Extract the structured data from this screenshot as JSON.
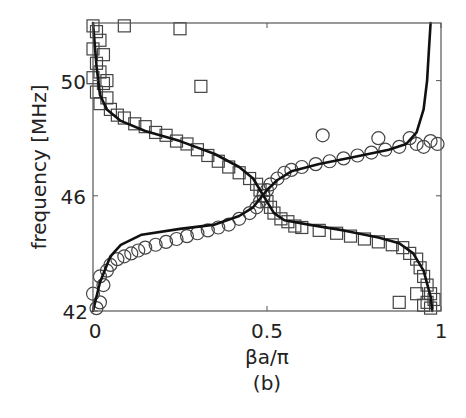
{
  "chart_data": {
    "type": "scatter",
    "title": "",
    "caption": "(b)",
    "xlabel": "βa/π",
    "ylabel": "frequency [MHz]",
    "xlim": [
      0,
      1
    ],
    "ylim": [
      42,
      52
    ],
    "xticks": [
      0,
      0.5,
      1
    ],
    "xtick_labels": [
      "0",
      "0.5",
      "1"
    ],
    "yticks": [
      42,
      46,
      50
    ],
    "ytick_labels": [
      "42",
      "46",
      "50"
    ],
    "grid": false,
    "legend": null,
    "series": [
      {
        "name": "measured-upper-branch-squares",
        "marker": "square",
        "points": [
          [
            0.0,
            51.9
          ],
          [
            0.01,
            51.7
          ],
          [
            0.02,
            51.4
          ],
          [
            0.0,
            51.1
          ],
          [
            0.03,
            50.9
          ],
          [
            0.01,
            50.6
          ],
          [
            0.02,
            50.3
          ],
          [
            0.0,
            50.1
          ],
          [
            0.03,
            49.9
          ],
          [
            0.01,
            49.6
          ],
          [
            0.04,
            49.4
          ],
          [
            0.02,
            49.2
          ],
          [
            0.05,
            49.0
          ],
          [
            0.07,
            48.8
          ],
          [
            0.09,
            48.7
          ],
          [
            0.12,
            48.5
          ],
          [
            0.15,
            48.4
          ],
          [
            0.18,
            48.2
          ],
          [
            0.21,
            48.1
          ],
          [
            0.24,
            47.9
          ],
          [
            0.27,
            47.8
          ],
          [
            0.3,
            47.6
          ],
          [
            0.33,
            47.4
          ],
          [
            0.36,
            47.2
          ],
          [
            0.39,
            47.0
          ],
          [
            0.42,
            46.8
          ],
          [
            0.45,
            46.6
          ],
          [
            0.47,
            46.4
          ],
          [
            0.48,
            46.2
          ],
          [
            0.49,
            46.0
          ],
          [
            0.5,
            45.8
          ],
          [
            0.51,
            45.6
          ],
          [
            0.52,
            45.4
          ],
          [
            0.54,
            45.2
          ],
          [
            0.56,
            45.1
          ],
          [
            0.58,
            44.95
          ],
          [
            0.6,
            44.9
          ],
          [
            0.65,
            44.8
          ],
          [
            0.7,
            44.7
          ],
          [
            0.74,
            44.6
          ],
          [
            0.78,
            44.5
          ],
          [
            0.82,
            44.4
          ],
          [
            0.86,
            44.3
          ],
          [
            0.89,
            44.2
          ],
          [
            0.91,
            44.0
          ],
          [
            0.93,
            43.8
          ],
          [
            0.94,
            43.5
          ],
          [
            0.95,
            43.2
          ],
          [
            0.96,
            42.9
          ],
          [
            0.97,
            42.6
          ],
          [
            0.96,
            42.3
          ],
          [
            0.97,
            42.1
          ],
          [
            0.98,
            42.4
          ],
          [
            0.95,
            42.2
          ]
        ],
        "outliers": [
          [
            0.09,
            51.9
          ],
          [
            0.25,
            51.8
          ],
          [
            0.31,
            49.8
          ],
          [
            0.88,
            42.3
          ],
          [
            0.93,
            42.6
          ],
          [
            0.04,
            50.0
          ]
        ]
      },
      {
        "name": "measured-lower-branch-circles",
        "marker": "circle",
        "points": [
          [
            0.01,
            42.1
          ],
          [
            0.02,
            42.3
          ],
          [
            0.0,
            42.6
          ],
          [
            0.03,
            42.9
          ],
          [
            0.02,
            43.2
          ],
          [
            0.04,
            43.4
          ],
          [
            0.05,
            43.6
          ],
          [
            0.07,
            43.8
          ],
          [
            0.09,
            43.9
          ],
          [
            0.11,
            44.0
          ],
          [
            0.13,
            44.1
          ],
          [
            0.15,
            44.2
          ],
          [
            0.18,
            44.3
          ],
          [
            0.21,
            44.4
          ],
          [
            0.24,
            44.5
          ],
          [
            0.27,
            44.6
          ],
          [
            0.3,
            44.7
          ],
          [
            0.33,
            44.8
          ],
          [
            0.36,
            44.9
          ],
          [
            0.39,
            45.0
          ],
          [
            0.42,
            45.2
          ],
          [
            0.45,
            45.4
          ],
          [
            0.47,
            45.6
          ],
          [
            0.48,
            45.8
          ],
          [
            0.49,
            46.0
          ],
          [
            0.5,
            46.2
          ],
          [
            0.51,
            46.4
          ],
          [
            0.53,
            46.6
          ],
          [
            0.55,
            46.8
          ],
          [
            0.57,
            46.9
          ],
          [
            0.6,
            47.0
          ],
          [
            0.64,
            47.1
          ],
          [
            0.68,
            47.2
          ],
          [
            0.72,
            47.3
          ],
          [
            0.76,
            47.4
          ],
          [
            0.8,
            47.5
          ],
          [
            0.84,
            47.6
          ],
          [
            0.88,
            47.7
          ],
          [
            0.93,
            47.8
          ],
          [
            0.97,
            47.9
          ],
          [
            0.99,
            47.8
          ],
          [
            0.95,
            47.7
          ]
        ],
        "outliers": [
          [
            0.66,
            48.1
          ],
          [
            0.82,
            48.0
          ],
          [
            0.91,
            48.0
          ]
        ]
      },
      {
        "name": "theory-curve-1",
        "style": "line",
        "points": [
          [
            0.0,
            52.0
          ],
          [
            0.01,
            50.5
          ],
          [
            0.02,
            49.5
          ],
          [
            0.04,
            49.0
          ],
          [
            0.08,
            48.6
          ],
          [
            0.15,
            48.25
          ],
          [
            0.25,
            47.9
          ],
          [
            0.35,
            47.45
          ],
          [
            0.42,
            47.0
          ],
          [
            0.46,
            46.6
          ],
          [
            0.48,
            46.2
          ],
          [
            0.5,
            45.8
          ],
          [
            0.52,
            45.4
          ],
          [
            0.55,
            45.15
          ],
          [
            0.62,
            45.0
          ],
          [
            0.72,
            44.8
          ],
          [
            0.82,
            44.55
          ],
          [
            0.88,
            44.35
          ],
          [
            0.92,
            44.0
          ],
          [
            0.95,
            43.4
          ],
          [
            0.97,
            42.5
          ],
          [
            0.975,
            42.0
          ]
        ]
      },
      {
        "name": "theory-curve-2",
        "style": "line",
        "points": [
          [
            0.0,
            42.0
          ],
          [
            0.02,
            43.0
          ],
          [
            0.05,
            43.9
          ],
          [
            0.08,
            44.3
          ],
          [
            0.14,
            44.65
          ],
          [
            0.25,
            44.85
          ],
          [
            0.35,
            45.0
          ],
          [
            0.42,
            45.3
          ],
          [
            0.46,
            45.6
          ],
          [
            0.48,
            45.9
          ],
          [
            0.5,
            46.2
          ],
          [
            0.53,
            46.55
          ],
          [
            0.57,
            46.85
          ],
          [
            0.65,
            47.1
          ],
          [
            0.75,
            47.35
          ],
          [
            0.85,
            47.6
          ],
          [
            0.9,
            47.8
          ],
          [
            0.93,
            48.2
          ],
          [
            0.95,
            49.0
          ],
          [
            0.96,
            50.0
          ],
          [
            0.965,
            51.0
          ],
          [
            0.97,
            52.0
          ]
        ]
      }
    ]
  }
}
